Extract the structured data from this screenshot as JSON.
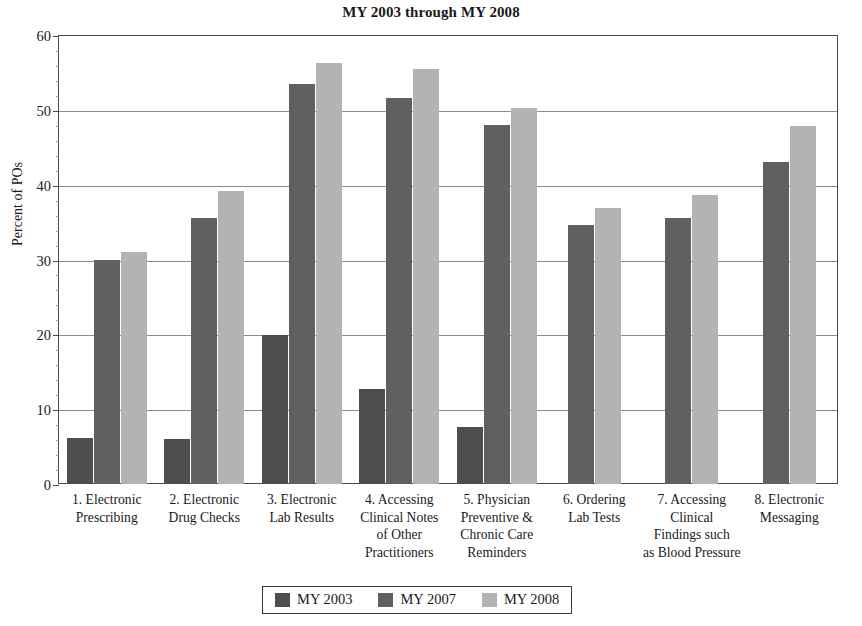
{
  "chart_data": {
    "type": "bar",
    "title": "MY 2003 through MY 2008",
    "xlabel": "",
    "ylabel": "Percent of POs",
    "ylim": [
      0,
      60
    ],
    "ytick_values": [
      0,
      10,
      20,
      30,
      40,
      50,
      60
    ],
    "ytick_labels": [
      "0",
      "10",
      "20",
      "30",
      "40",
      "50",
      "60"
    ],
    "grid": true,
    "legend_position": "bottom",
    "categories": [
      "1. Electronic\nPrescribing",
      "2. Electronic\nDrug Checks",
      "3. Electronic\nLab Results",
      "4. Accessing\nClinical Notes\nof Other\nPractitioners",
      "5. Physician\nPreventive &\nChronic Care\nReminders",
      "6. Ordering\nLab Tests",
      "7. Accessing\nClinical\nFindings such\nas Blood Pressure",
      "8. Electronic\nMessaging"
    ],
    "category_lines": [
      [
        "1. Electronic",
        "Prescribing"
      ],
      [
        "2. Electronic",
        "Drug Checks"
      ],
      [
        "3. Electronic",
        "Lab Results"
      ],
      [
        "4. Accessing",
        "Clinical Notes",
        "of Other",
        "Practitioners"
      ],
      [
        "5. Physician",
        "Preventive &",
        "Chronic Care",
        "Reminders"
      ],
      [
        "6. Ordering",
        "Lab Tests"
      ],
      [
        "7. Accessing",
        "Clinical",
        "Findings such",
        "as Blood Pressure"
      ],
      [
        "8. Electronic",
        "Messaging"
      ]
    ],
    "series": [
      {
        "name": "MY 2003",
        "color": "#4e4e4e",
        "values": [
          6.1,
          6.0,
          19.9,
          12.7,
          7.6,
          null,
          null,
          null
        ]
      },
      {
        "name": "MY 2007",
        "color": "#606060",
        "values": [
          30.0,
          35.5,
          53.4,
          51.6,
          48.0,
          34.6,
          35.5,
          43.0
        ]
      },
      {
        "name": "MY 2008",
        "color": "#b3b3b3",
        "values": [
          31.0,
          39.1,
          56.2,
          55.4,
          50.2,
          36.9,
          38.6,
          47.8
        ]
      }
    ]
  },
  "legend": {
    "items": [
      {
        "label": "MY 2003",
        "color": "#4e4e4e"
      },
      {
        "label": "MY 2007",
        "color": "#606060"
      },
      {
        "label": "MY 2008",
        "color": "#b3b3b3"
      }
    ]
  },
  "colors": {
    "my2003": "#4e4e4e",
    "my2007": "#606060",
    "my2008": "#b3b3b3",
    "axis": "#4a4a4a",
    "grid": "#8c8c8c",
    "text": "#1a1a1a"
  }
}
